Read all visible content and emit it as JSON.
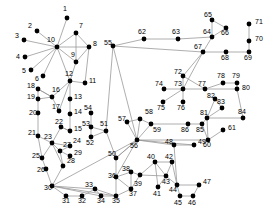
{
  "diagram": {
    "type": "node-link-graph",
    "title": "",
    "node_color": "#000000",
    "edge_color": "#999999",
    "label_color": "#000000",
    "background": "#ffffff",
    "node_radius": 2.4,
    "node_count": 86,
    "nodes": [
      {
        "id": "1",
        "x": 67,
        "y": 18,
        "lx": 63,
        "ly": 11
      },
      {
        "id": "2",
        "x": 37,
        "y": 31,
        "lx": 28,
        "ly": 28
      },
      {
        "id": "3",
        "x": 24,
        "y": 40,
        "lx": 15,
        "ly": 38
      },
      {
        "id": "4",
        "x": 25,
        "y": 57,
        "lx": 16,
        "ly": 59
      },
      {
        "id": "5",
        "x": 31,
        "y": 70,
        "lx": 22,
        "ly": 73
      },
      {
        "id": "6",
        "x": 43,
        "y": 76,
        "lx": 35,
        "ly": 81
      },
      {
        "id": "7",
        "x": 76,
        "y": 33,
        "lx": 79,
        "ly": 28
      },
      {
        "id": "8",
        "x": 89,
        "y": 47,
        "lx": 93,
        "ly": 46
      },
      {
        "id": "9",
        "x": 76,
        "y": 62,
        "lx": 71,
        "ly": 57
      },
      {
        "id": "10",
        "x": 57,
        "y": 47,
        "lx": 47,
        "ly": 42
      },
      {
        "id": "11",
        "x": 85,
        "y": 83,
        "lx": 89,
        "ly": 83
      },
      {
        "id": "12",
        "x": 70,
        "y": 81,
        "lx": 65,
        "ly": 76
      },
      {
        "id": "13",
        "x": 70,
        "y": 99,
        "lx": 74,
        "ly": 99
      },
      {
        "id": "14",
        "x": 70,
        "y": 114,
        "lx": 74,
        "ly": 114
      },
      {
        "id": "15",
        "x": 70,
        "y": 131,
        "lx": 74,
        "ly": 131
      },
      {
        "id": "16",
        "x": 52,
        "y": 97,
        "lx": 52,
        "ly": 92
      },
      {
        "id": "17",
        "x": 59,
        "y": 111,
        "lx": 52,
        "ly": 109
      },
      {
        "id": "18",
        "x": 38,
        "y": 89,
        "lx": 27,
        "ly": 88
      },
      {
        "id": "19",
        "x": 38,
        "y": 99,
        "lx": 27,
        "ly": 99
      },
      {
        "id": "20",
        "x": 38,
        "y": 113,
        "lx": 29,
        "ly": 115
      },
      {
        "id": "21",
        "x": 38,
        "y": 136,
        "lx": 28,
        "ly": 135
      },
      {
        "id": "22",
        "x": 61,
        "y": 127,
        "lx": 55,
        "ly": 124
      },
      {
        "id": "23",
        "x": 52,
        "y": 143,
        "lx": 44,
        "ly": 139
      },
      {
        "id": "24",
        "x": 70,
        "y": 146,
        "lx": 73,
        "ly": 143
      },
      {
        "id": "25",
        "x": 42,
        "y": 158,
        "lx": 32,
        "ly": 158
      },
      {
        "id": "26",
        "x": 46,
        "y": 169,
        "lx": 37,
        "ly": 172
      },
      {
        "id": "27",
        "x": 60,
        "y": 151,
        "lx": 63,
        "ly": 147
      },
      {
        "id": "28",
        "x": 63,
        "y": 166,
        "lx": 67,
        "ly": 163
      },
      {
        "id": "29",
        "x": 70,
        "y": 156,
        "lx": 74,
        "ly": 155
      },
      {
        "id": "30",
        "x": 52,
        "y": 186,
        "lx": 44,
        "ly": 190
      },
      {
        "id": "31",
        "x": 66,
        "y": 196,
        "lx": 62,
        "ly": 203
      },
      {
        "id": "32",
        "x": 82,
        "y": 196,
        "lx": 78,
        "ly": 203
      },
      {
        "id": "33",
        "x": 95,
        "y": 189,
        "lx": 85,
        "ly": 187
      },
      {
        "id": "34",
        "x": 101,
        "y": 196,
        "lx": 97,
        "ly": 203
      },
      {
        "id": "35",
        "x": 116,
        "y": 196,
        "lx": 112,
        "ly": 203
      },
      {
        "id": "36",
        "x": 116,
        "y": 177,
        "lx": 108,
        "ly": 178
      },
      {
        "id": "37",
        "x": 131,
        "y": 189,
        "lx": 129,
        "ly": 196
      },
      {
        "id": "38",
        "x": 131,
        "y": 172,
        "lx": 122,
        "ly": 171
      },
      {
        "id": "39",
        "x": 140,
        "y": 175,
        "lx": 134,
        "ly": 186
      },
      {
        "id": "40",
        "x": 155,
        "y": 162,
        "lx": 147,
        "ly": 159
      },
      {
        "id": "41",
        "x": 158,
        "y": 187,
        "lx": 153,
        "ly": 196
      },
      {
        "id": "42",
        "x": 172,
        "y": 162,
        "lx": 165,
        "ly": 159
      },
      {
        "id": "43",
        "x": 166,
        "y": 176,
        "lx": 162,
        "ly": 184
      },
      {
        "id": "44",
        "x": 177,
        "y": 185,
        "lx": 169,
        "ly": 192
      },
      {
        "id": "45",
        "x": 180,
        "y": 196,
        "lx": 174,
        "ly": 205
      },
      {
        "id": "46",
        "x": 193,
        "y": 196,
        "lx": 188,
        "ly": 205
      },
      {
        "id": "47",
        "x": 199,
        "y": 185,
        "lx": 203,
        "ly": 184
      },
      {
        "id": "48",
        "x": 174,
        "y": 145,
        "lx": 165,
        "ly": 144
      },
      {
        "id": "49",
        "x": 194,
        "y": 145,
        "lx": 198,
        "ly": 144
      },
      {
        "id": "50",
        "x": 116,
        "y": 158,
        "lx": 108,
        "ly": 156
      },
      {
        "id": "51",
        "x": 106,
        "y": 131,
        "lx": 100,
        "ly": 126
      },
      {
        "id": "52",
        "x": 91,
        "y": 137,
        "lx": 86,
        "ly": 145
      },
      {
        "id": "53",
        "x": 91,
        "y": 127,
        "lx": 82,
        "ly": 126
      },
      {
        "id": "54",
        "x": 91,
        "y": 113,
        "lx": 84,
        "ly": 110
      },
      {
        "id": "55",
        "x": 113,
        "y": 46,
        "lx": 104,
        "ly": 45
      },
      {
        "id": "56",
        "x": 137,
        "y": 140,
        "lx": 130,
        "ly": 148
      },
      {
        "id": "57",
        "x": 127,
        "y": 122,
        "lx": 118,
        "ly": 121
      },
      {
        "id": "58",
        "x": 140,
        "y": 119,
        "lx": 145,
        "ly": 114
      },
      {
        "id": "59",
        "x": 151,
        "y": 124,
        "lx": 153,
        "ly": 132
      },
      {
        "id": "60",
        "x": 208,
        "y": 140,
        "lx": 203,
        "ly": 147
      },
      {
        "id": "61",
        "x": 223,
        "y": 130,
        "lx": 228,
        "ly": 130
      },
      {
        "id": "62",
        "x": 144,
        "y": 39,
        "lx": 138,
        "ly": 34
      },
      {
        "id": "63",
        "x": 178,
        "y": 39,
        "lx": 172,
        "ly": 34
      },
      {
        "id": "64",
        "x": 212,
        "y": 37,
        "lx": 203,
        "ly": 34
      },
      {
        "id": "65",
        "x": 212,
        "y": 20,
        "lx": 204,
        "ly": 17
      },
      {
        "id": "66",
        "x": 226,
        "y": 28,
        "lx": 221,
        "ly": 35
      },
      {
        "id": "67",
        "x": 203,
        "y": 52,
        "lx": 194,
        "ly": 49
      },
      {
        "id": "68",
        "x": 226,
        "y": 52,
        "lx": 221,
        "ly": 60
      },
      {
        "id": "69",
        "x": 249,
        "y": 52,
        "lx": 244,
        "ly": 60
      },
      {
        "id": "70",
        "x": 249,
        "y": 41,
        "lx": 255,
        "ly": 41
      },
      {
        "id": "71",
        "x": 249,
        "y": 24,
        "lx": 255,
        "ly": 24
      },
      {
        "id": "72",
        "x": 183,
        "y": 76,
        "lx": 174,
        "ly": 74
      },
      {
        "id": "73",
        "x": 183,
        "y": 89,
        "lx": 174,
        "ly": 86
      },
      {
        "id": "74",
        "x": 164,
        "y": 89,
        "lx": 155,
        "ly": 86
      },
      {
        "id": "75",
        "x": 163,
        "y": 102,
        "lx": 157,
        "ly": 110
      },
      {
        "id": "76",
        "x": 183,
        "y": 102,
        "lx": 177,
        "ly": 110
      },
      {
        "id": "77",
        "x": 205,
        "y": 89,
        "lx": 198,
        "ly": 86
      },
      {
        "id": "78",
        "x": 223,
        "y": 83,
        "lx": 217,
        "ly": 78
      },
      {
        "id": "79",
        "x": 237,
        "y": 83,
        "lx": 232,
        "ly": 78
      },
      {
        "id": "80",
        "x": 237,
        "y": 89,
        "lx": 242,
        "ly": 90
      },
      {
        "id": "81",
        "x": 207,
        "y": 118,
        "lx": 200,
        "ly": 115
      },
      {
        "id": "82",
        "x": 215,
        "y": 99,
        "lx": 207,
        "ly": 98
      },
      {
        "id": "83",
        "x": 222,
        "y": 108,
        "lx": 217,
        "ly": 104
      },
      {
        "id": "84",
        "x": 243,
        "y": 118,
        "lx": 238,
        "ly": 114
      },
      {
        "id": "85",
        "x": 202,
        "y": 124,
        "lx": 196,
        "ly": 132
      },
      {
        "id": "86",
        "x": 188,
        "y": 124,
        "lx": 181,
        "ly": 132
      }
    ],
    "edges": [
      [
        "1",
        "10"
      ],
      [
        "2",
        "10"
      ],
      [
        "3",
        "10"
      ],
      [
        "4",
        "10"
      ],
      [
        "5",
        "10"
      ],
      [
        "6",
        "10"
      ],
      [
        "7",
        "10"
      ],
      [
        "8",
        "10"
      ],
      [
        "9",
        "10"
      ],
      [
        "10",
        "12"
      ],
      [
        "7",
        "8"
      ],
      [
        "7",
        "9"
      ],
      [
        "8",
        "9"
      ],
      [
        "8",
        "11"
      ],
      [
        "9",
        "12"
      ],
      [
        "11",
        "12"
      ],
      [
        "12",
        "13"
      ],
      [
        "12",
        "16"
      ],
      [
        "12",
        "17"
      ],
      [
        "13",
        "14"
      ],
      [
        "14",
        "15"
      ],
      [
        "15",
        "22"
      ],
      [
        "16",
        "17"
      ],
      [
        "16",
        "18"
      ],
      [
        "16",
        "19"
      ],
      [
        "18",
        "19"
      ],
      [
        "18",
        "16"
      ],
      [
        "19",
        "20"
      ],
      [
        "20",
        "21"
      ],
      [
        "21",
        "23"
      ],
      [
        "21",
        "25"
      ],
      [
        "22",
        "23"
      ],
      [
        "22",
        "15"
      ],
      [
        "23",
        "24"
      ],
      [
        "23",
        "27"
      ],
      [
        "23",
        "25"
      ],
      [
        "23",
        "28"
      ],
      [
        "24",
        "27"
      ],
      [
        "27",
        "29"
      ],
      [
        "27",
        "28"
      ],
      [
        "25",
        "26"
      ],
      [
        "26",
        "30"
      ],
      [
        "28",
        "30"
      ],
      [
        "30",
        "31"
      ],
      [
        "30",
        "33"
      ],
      [
        "30",
        "34"
      ],
      [
        "30",
        "35"
      ],
      [
        "30",
        "56"
      ],
      [
        "31",
        "32"
      ],
      [
        "32",
        "33"
      ],
      [
        "33",
        "34"
      ],
      [
        "33",
        "35"
      ],
      [
        "34",
        "35"
      ],
      [
        "35",
        "36"
      ],
      [
        "35",
        "37"
      ],
      [
        "36",
        "50"
      ],
      [
        "36",
        "38"
      ],
      [
        "36",
        "56"
      ],
      [
        "37",
        "38"
      ],
      [
        "37",
        "39"
      ],
      [
        "38",
        "39"
      ],
      [
        "39",
        "40"
      ],
      [
        "39",
        "43"
      ],
      [
        "40",
        "42"
      ],
      [
        "40",
        "43"
      ],
      [
        "40",
        "41"
      ],
      [
        "41",
        "43"
      ],
      [
        "42",
        "43"
      ],
      [
        "42",
        "44"
      ],
      [
        "43",
        "44"
      ],
      [
        "44",
        "45"
      ],
      [
        "44",
        "47"
      ],
      [
        "44",
        "48"
      ],
      [
        "45",
        "46"
      ],
      [
        "46",
        "47"
      ],
      [
        "48",
        "49"
      ],
      [
        "48",
        "56"
      ],
      [
        "49",
        "56"
      ],
      [
        "50",
        "51"
      ],
      [
        "50",
        "56"
      ],
      [
        "51",
        "52"
      ],
      [
        "51",
        "53"
      ],
      [
        "52",
        "53"
      ],
      [
        "53",
        "54"
      ],
      [
        "51",
        "55"
      ],
      [
        "55",
        "56"
      ],
      [
        "55",
        "62"
      ],
      [
        "55",
        "67"
      ],
      [
        "56",
        "57"
      ],
      [
        "56",
        "58"
      ],
      [
        "56",
        "59"
      ],
      [
        "56",
        "60"
      ],
      [
        "57",
        "58"
      ],
      [
        "58",
        "59"
      ],
      [
        "59",
        "86"
      ],
      [
        "60",
        "61"
      ],
      [
        "60",
        "81"
      ],
      [
        "60",
        "85"
      ],
      [
        "62",
        "63"
      ],
      [
        "63",
        "64"
      ],
      [
        "64",
        "65"
      ],
      [
        "64",
        "66"
      ],
      [
        "64",
        "67"
      ],
      [
        "65",
        "66"
      ],
      [
        "67",
        "68"
      ],
      [
        "67",
        "72"
      ],
      [
        "67",
        "73"
      ],
      [
        "68",
        "69"
      ],
      [
        "69",
        "70"
      ],
      [
        "70",
        "71"
      ],
      [
        "72",
        "73"
      ],
      [
        "72",
        "77"
      ],
      [
        "73",
        "74"
      ],
      [
        "73",
        "75"
      ],
      [
        "73",
        "76"
      ],
      [
        "73",
        "77"
      ],
      [
        "77",
        "78"
      ],
      [
        "77",
        "80"
      ],
      [
        "78",
        "79"
      ],
      [
        "79",
        "80"
      ],
      [
        "80",
        "84"
      ],
      [
        "81",
        "82"
      ],
      [
        "81",
        "83"
      ],
      [
        "81",
        "84"
      ],
      [
        "81",
        "85"
      ],
      [
        "82",
        "83"
      ],
      [
        "85",
        "86"
      ],
      [
        "36",
        "37"
      ],
      [
        "56",
        "50"
      ]
    ]
  }
}
